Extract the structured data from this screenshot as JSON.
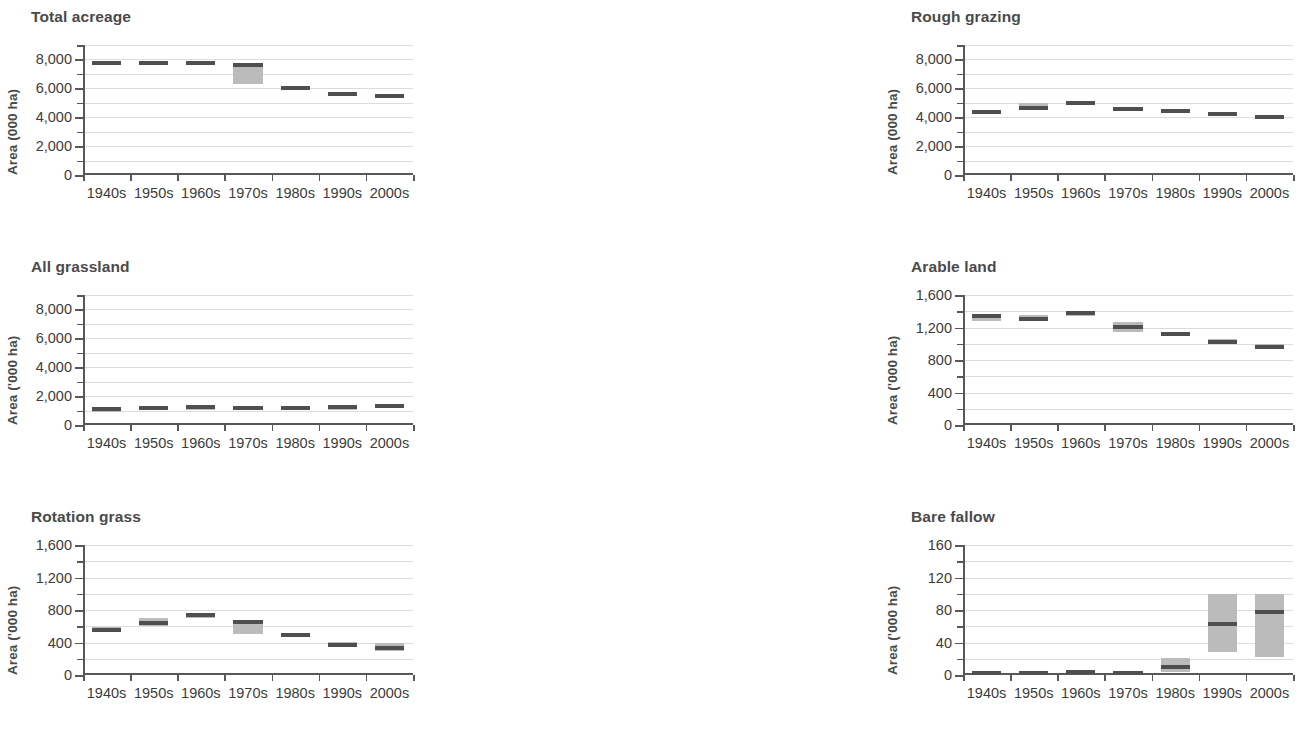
{
  "figure": {
    "categories": [
      "1940s",
      "1950s",
      "1960s",
      "1970s",
      "1980s",
      "1990s",
      "2000s"
    ],
    "box_fill": "#bbbbbb",
    "median_color": "#4f4f4f",
    "grid_color": "#dcdcdc",
    "axis_color": "#58585a"
  },
  "chart_data": [
    {
      "type": "bar",
      "panel": 1,
      "title": "Total acreage",
      "ylabel": "Area (000 ha)",
      "xlabel": "",
      "categories": [
        "1940s",
        "1950s",
        "1960s",
        "1970s",
        "1980s",
        "1990s",
        "2000s"
      ],
      "ylim": [
        0,
        9000
      ],
      "yticks": [
        0,
        2000,
        4000,
        6000,
        8000
      ],
      "ytick_labels": [
        "0",
        "2,000",
        "4,000",
        "6,000",
        "8,000"
      ],
      "minor_step": 1000,
      "grid": true,
      "boxes": [
        {
          "category": "1940s",
          "low": 7700,
          "high": 7820,
          "median": 7760
        },
        {
          "category": "1950s",
          "low": 7700,
          "high": 7820,
          "median": 7760
        },
        {
          "category": "1960s",
          "low": 7700,
          "high": 7820,
          "median": 7760
        },
        {
          "category": "1970s",
          "low": 6300,
          "high": 7700,
          "median": 7600
        },
        {
          "category": "1980s",
          "low": 5950,
          "high": 6120,
          "median": 6030
        },
        {
          "category": "1990s",
          "low": 5520,
          "high": 5700,
          "median": 5610
        },
        {
          "category": "2000s",
          "low": 5440,
          "high": 5560,
          "median": 5500
        }
      ]
    },
    {
      "type": "bar",
      "panel": 2,
      "title": "Rough grazing",
      "ylabel": "Area (000 ha)",
      "xlabel": "",
      "categories": [
        "1940s",
        "1950s",
        "1960s",
        "1970s",
        "1980s",
        "1990s",
        "2000s"
      ],
      "ylim": [
        0,
        9000
      ],
      "yticks": [
        0,
        2000,
        4000,
        6000,
        8000
      ],
      "ytick_labels": [
        "0",
        "2,000",
        "4,000",
        "6,000",
        "8,000"
      ],
      "minor_step": 1000,
      "grid": true,
      "boxes": [
        {
          "category": "1940s",
          "low": 4280,
          "high": 4440,
          "median": 4350
        },
        {
          "category": "1950s",
          "low": 4560,
          "high": 4960,
          "median": 4650
        },
        {
          "category": "1960s",
          "low": 4940,
          "high": 5060,
          "median": 5000
        },
        {
          "category": "1970s",
          "low": 4500,
          "high": 4620,
          "median": 4560
        },
        {
          "category": "1980s",
          "low": 4390,
          "high": 4520,
          "median": 4450
        },
        {
          "category": "1990s",
          "low": 4150,
          "high": 4280,
          "median": 4210
        },
        {
          "category": "2000s",
          "low": 3950,
          "high": 4070,
          "median": 4010
        }
      ]
    },
    {
      "type": "bar",
      "panel": 3,
      "title": "Total crops and grass",
      "ylabel": "Area (000 ha)",
      "xlabel": "",
      "categories": [
        "1940s",
        "1950s",
        "1960s",
        "1970s",
        "1980s",
        "1990s",
        "2000s"
      ],
      "ylim": [
        0,
        9000
      ],
      "yticks": [
        0,
        2000,
        4000,
        6000,
        8000
      ],
      "ytick_labels": [
        "0",
        "2,000",
        "4,000",
        "6,000",
        "8,000"
      ],
      "minor_step": 1000,
      "grid": true,
      "boxes": [
        {
          "category": "1940s",
          "low": 1740,
          "high": 1860,
          "median": 1800
        },
        {
          "category": "1950s",
          "low": 1740,
          "high": 1860,
          "median": 1800
        },
        {
          "category": "1960s",
          "low": 1720,
          "high": 1840,
          "median": 1780
        },
        {
          "category": "1970s",
          "low": 1640,
          "high": 1760,
          "median": 1700
        },
        {
          "category": "1980s",
          "low": 1740,
          "high": 1860,
          "median": 1800
        },
        {
          "category": "1990s",
          "low": 1770,
          "high": 1890,
          "median": 1830
        },
        {
          "category": "2000s",
          "low": 1800,
          "high": 1920,
          "median": 1860
        }
      ]
    },
    {
      "type": "bar",
      "panel": 4,
      "title": "All grassland",
      "ylabel": "Area ('000 ha)",
      "xlabel": "",
      "categories": [
        "1940s",
        "1950s",
        "1960s",
        "1970s",
        "1980s",
        "1990s",
        "2000s"
      ],
      "ylim": [
        0,
        9000
      ],
      "yticks": [
        0,
        2000,
        4000,
        6000,
        8000
      ],
      "ytick_labels": [
        "0",
        "2,000",
        "4,000",
        "6,000",
        "8,000"
      ],
      "minor_step": 1000,
      "grid": true,
      "boxes": [
        {
          "category": "1940s",
          "low": 1020,
          "high": 1140,
          "median": 1080
        },
        {
          "category": "1950s",
          "low": 1120,
          "high": 1260,
          "median": 1190
        },
        {
          "category": "1960s",
          "low": 1160,
          "high": 1280,
          "median": 1220
        },
        {
          "category": "1970s",
          "low": 1120,
          "high": 1240,
          "median": 1180
        },
        {
          "category": "1980s",
          "low": 1110,
          "high": 1230,
          "median": 1170
        },
        {
          "category": "1990s",
          "low": 1160,
          "high": 1280,
          "median": 1220
        },
        {
          "category": "2000s",
          "low": 1260,
          "high": 1400,
          "median": 1330
        }
      ]
    },
    {
      "type": "bar",
      "panel": 5,
      "title": "Arable land",
      "ylabel": "Area ('000 ha)",
      "xlabel": "",
      "categories": [
        "1940s",
        "1950s",
        "1960s",
        "1970s",
        "1980s",
        "1990s",
        "2000s"
      ],
      "ylim": [
        0,
        1600
      ],
      "yticks": [
        0,
        400,
        800,
        1200,
        1600
      ],
      "ytick_labels": [
        "0",
        "400",
        "800",
        "1,200",
        "1,600"
      ],
      "minor_step": 200,
      "grid": true,
      "boxes": [
        {
          "category": "1940s",
          "low": 1280,
          "high": 1370,
          "median": 1340
        },
        {
          "category": "1950s",
          "low": 1285,
          "high": 1350,
          "median": 1310
        },
        {
          "category": "1960s",
          "low": 1340,
          "high": 1405,
          "median": 1380
        },
        {
          "category": "1970s",
          "low": 1145,
          "high": 1265,
          "median": 1205
        },
        {
          "category": "1980s",
          "low": 1095,
          "high": 1150,
          "median": 1120
        },
        {
          "category": "1990s",
          "low": 995,
          "high": 1055,
          "median": 1020
        },
        {
          "category": "2000s",
          "low": 935,
          "high": 995,
          "median": 960
        }
      ]
    },
    {
      "type": "bar",
      "panel": 6,
      "title": "Permanent grass",
      "ylabel": "Area ('000 ha)",
      "xlabel": "",
      "categories": [
        "1940s",
        "1950s",
        "1960s",
        "1970s",
        "1980s",
        "1990s",
        "2000s"
      ],
      "ylim": [
        0,
        1600
      ],
      "yticks": [
        0,
        400,
        800,
        1200,
        1600
      ],
      "ytick_labels": [
        "0",
        "400",
        "800",
        "1,200",
        "1,600"
      ],
      "minor_step": 200,
      "grid": true,
      "boxes": [
        {
          "category": "1940s",
          "low": 405,
          "high": 600,
          "median": 480
        },
        {
          "category": "1950s",
          "low": 425,
          "high": 505,
          "median": 475
        },
        {
          "category": "1960s",
          "low": 355,
          "high": 430,
          "median": 395
        },
        {
          "category": "1970s",
          "low": 415,
          "high": 570,
          "median": 440
        },
        {
          "category": "1980s",
          "low": 575,
          "high": 655,
          "median": 610
        },
        {
          "category": "1990s",
          "low": 715,
          "high": 815,
          "median": 770
        },
        {
          "category": "2000s",
          "low": 885,
          "high": 945,
          "median": 915
        }
      ]
    },
    {
      "type": "bar",
      "panel": 7,
      "title": "Rotation grass",
      "ylabel": "Area ('000 ha)",
      "xlabel": "",
      "categories": [
        "1940s",
        "1950s",
        "1960s",
        "1970s",
        "1980s",
        "1990s",
        "2000s"
      ],
      "ylim": [
        0,
        1600
      ],
      "yticks": [
        0,
        400,
        800,
        1200,
        1600
      ],
      "ytick_labels": [
        "0",
        "400",
        "800",
        "1,200",
        "1,600"
      ],
      "minor_step": 200,
      "grid": true,
      "boxes": [
        {
          "category": "1940s",
          "low": 535,
          "high": 585,
          "median": 558
        },
        {
          "category": "1950s",
          "low": 605,
          "high": 700,
          "median": 640
        },
        {
          "category": "1960s",
          "low": 705,
          "high": 765,
          "median": 742
        },
        {
          "category": "1970s",
          "low": 505,
          "high": 670,
          "median": 650
        },
        {
          "category": "1980s",
          "low": 465,
          "high": 505,
          "median": 487
        },
        {
          "category": "1990s",
          "low": 340,
          "high": 405,
          "median": 370
        },
        {
          "category": "2000s",
          "low": 300,
          "high": 400,
          "median": 330
        }
      ]
    },
    {
      "type": "bar",
      "panel": 8,
      "title": "Bare fallow",
      "ylabel": "Area ('000 ha)",
      "xlabel": "",
      "categories": [
        "1940s",
        "1950s",
        "1960s",
        "1970s",
        "1980s",
        "1990s",
        "2000s"
      ],
      "ylim": [
        0,
        160
      ],
      "yticks": [
        0,
        40,
        80,
        120,
        160
      ],
      "ytick_labels": [
        "0",
        "40",
        "80",
        "120",
        "160"
      ],
      "minor_step": 20,
      "grid": true,
      "boxes": [
        {
          "category": "1940s",
          "low": 0,
          "high": 4,
          "median": 2
        },
        {
          "category": "1950s",
          "low": 1,
          "high": 5,
          "median": 3
        },
        {
          "category": "1960s",
          "low": 2,
          "high": 6,
          "median": 4
        },
        {
          "category": "1970s",
          "low": 1,
          "high": 5,
          "median": 3
        },
        {
          "category": "1980s",
          "low": 4,
          "high": 21,
          "median": 10
        },
        {
          "category": "1990s",
          "low": 28,
          "high": 100,
          "median": 63
        },
        {
          "category": "2000s",
          "low": 22,
          "high": 100,
          "median": 78
        }
      ]
    },
    {
      "type": "bar",
      "panel": 9,
      "title": "Linear—hedgerows",
      "ylabel": "Area ('000 ha)",
      "xlabel": "",
      "categories": [
        "1940s",
        "1950s",
        "1960s",
        "1970s",
        "1980s",
        "1990s",
        "2000s"
      ],
      "ylim": [
        0,
        60000
      ],
      "yticks": [
        0,
        20000,
        40000,
        60000
      ],
      "ytick_labels": [
        "0",
        "20,000",
        "40,000",
        "60,000"
      ],
      "minor_step": 10000,
      "grid": true,
      "boxes": [
        {
          "category": "1940s",
          "low": 35500,
          "high": 50000,
          "median": 42500
        },
        {
          "category": "1950s",
          "low": null,
          "high": null,
          "median": null
        },
        {
          "category": "1960s",
          "low": null,
          "high": null,
          "median": null
        },
        {
          "category": "1970s",
          "low": 22000,
          "high": 29500,
          "median": 26200
        },
        {
          "category": "1980s",
          "low": 18000,
          "high": 22000,
          "median": 19500
        },
        {
          "category": "1990s",
          "low": null,
          "high": null,
          "median": null
        },
        {
          "category": "2000s",
          "low": null,
          "high": null,
          "median": null
        }
      ]
    }
  ]
}
